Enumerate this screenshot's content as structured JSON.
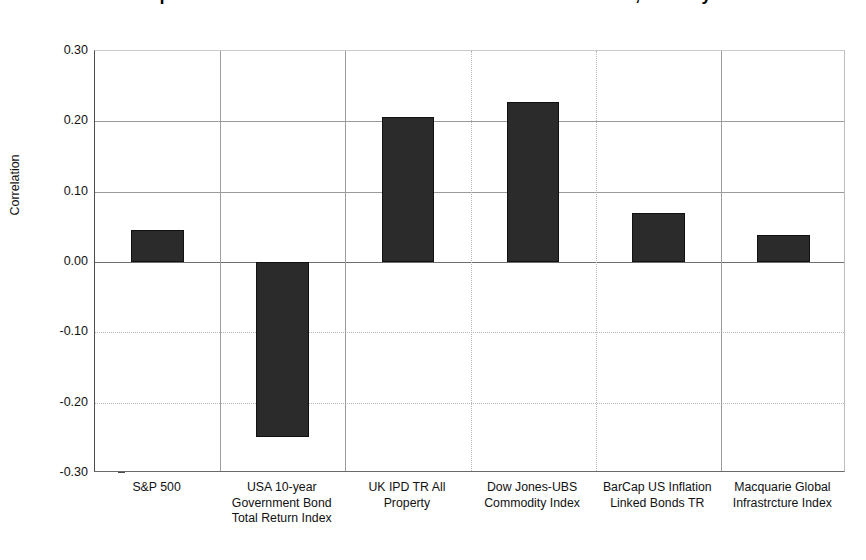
{
  "chart_data": {
    "type": "bar",
    "title": "Correlation of Macquarie Global Infrastructure Index with other asset classes, January 2000 to June 2012",
    "subtitle": "",
    "xlabel": "",
    "ylabel": "Correlation",
    "ylim": [
      -0.3,
      0.3
    ],
    "ytick_values": [
      0.3,
      0.2,
      0.1,
      0.0,
      -0.1,
      -0.2,
      -0.3
    ],
    "ytick_labels": [
      "0.30",
      "0.20",
      "0.10",
      "0.00",
      "-0.10",
      "-0.20",
      "-0.30"
    ],
    "grid": true,
    "legend": null,
    "categories": [
      "S&P 500",
      "USA 10-year Government Bond Total Return Index",
      "UK IPD TR All Property",
      "Dow Jones-UBS Commodity Index",
      "BarCap US Inflation Linked Bonds TR",
      "Macquarie Global Infrastrcture Index"
    ],
    "category_lines": [
      [
        "S&P 500"
      ],
      [
        "USA 10-year",
        "Government Bond",
        "Total Return Index"
      ],
      [
        "UK IPD TR All",
        "Property"
      ],
      [
        "Dow Jones-UBS",
        "Commodity Index"
      ],
      [
        "BarCap US Inflation",
        "Linked Bonds TR"
      ],
      [
        "Macquarie Global",
        "Infrastrcture Index"
      ]
    ],
    "values": [
      0.046,
      -0.249,
      0.206,
      0.227,
      0.07,
      0.039
    ],
    "series": [
      {
        "name": "Correlation",
        "values": [
          0.046,
          -0.249,
          0.206,
          0.227,
          0.07,
          0.039
        ],
        "color": "#2b2b2b"
      }
    ],
    "bar_color": "#2b2b2b",
    "axis_color": "#4d4d4d",
    "grid_color": "#9a9a9a",
    "background": "#ffffff"
  }
}
